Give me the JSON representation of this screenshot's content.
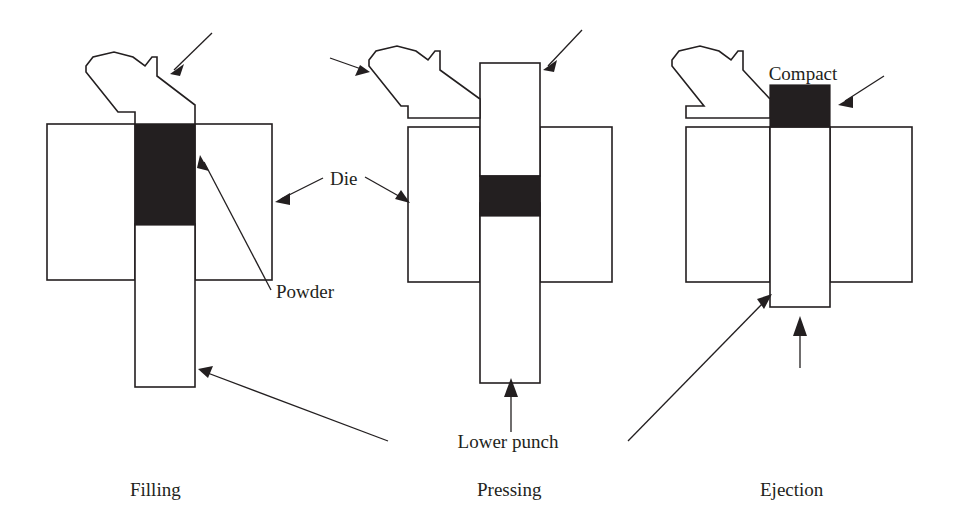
{
  "figure": {
    "background_color": "#ffffff",
    "line_color": "#231f20",
    "fill_color": "#231f20"
  },
  "labels": {
    "die": "Die",
    "powder": "Powder",
    "compact": "Compact",
    "lower_punch": "Lower punch"
  },
  "captions": {
    "stage1": "Filling",
    "stage2": "Pressing",
    "stage3": "Ejection"
  },
  "stages": [
    {
      "name": "Filling",
      "caption": "Filling",
      "upper_punch_position": "raised above die",
      "powder_state": "loose powder filling die cavity",
      "lower_punch_position": "lowered, deep in die"
    },
    {
      "name": "Pressing",
      "caption": "Pressing",
      "upper_punch_position": "inserted into die cavity",
      "powder_state": "powder compressed into thin compact",
      "lower_punch_position": "raised, pressing upward"
    },
    {
      "name": "Ejection",
      "caption": "Ejection",
      "upper_punch_position": "withdrawn above die",
      "powder_state": "finished compact ejected above die face",
      "lower_punch_position": "raised to die top face"
    }
  ],
  "annotations": [
    {
      "id": "upper-punch-arrow-1",
      "target": "upper punch",
      "stage": "Filling",
      "label": ""
    },
    {
      "id": "upper-punch-arrow-2",
      "target": "upper punch",
      "stage": "Pressing",
      "label": ""
    },
    {
      "id": "upper-punch-arrow-3",
      "target": "upper punch",
      "stage": "Pressing",
      "label": ""
    },
    {
      "id": "die-arrow-left",
      "target": "die",
      "stage": "Pressing",
      "label": "Die"
    },
    {
      "id": "die-arrow-right",
      "target": "die",
      "stage": "Filling",
      "label": "Die"
    },
    {
      "id": "powder-arrow",
      "target": "powder",
      "stage": "Filling",
      "label": "Powder"
    },
    {
      "id": "compact-arrow",
      "target": "compact",
      "stage": "Ejection",
      "label": "Compact"
    },
    {
      "id": "lower-punch-arrow-left",
      "target": "lower punch",
      "stage": "Filling",
      "label": "Lower punch"
    },
    {
      "id": "lower-punch-arrow-right",
      "target": "lower punch",
      "stage": "Ejection",
      "label": "Lower punch"
    },
    {
      "id": "press-force-arrow-mid",
      "target": "lower punch",
      "stage": "Pressing",
      "label": ""
    },
    {
      "id": "press-force-arrow-right",
      "target": "lower punch",
      "stage": "Ejection",
      "label": ""
    }
  ]
}
